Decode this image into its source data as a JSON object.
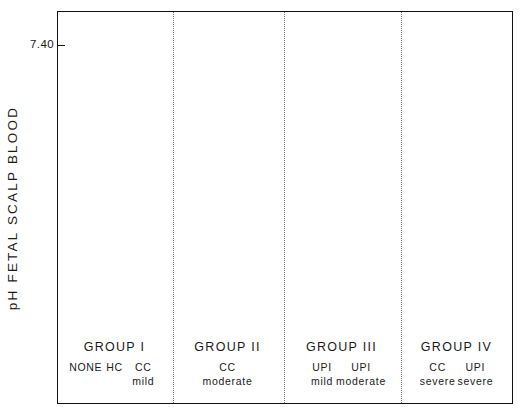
{
  "chart_data": {
    "type": "scatter",
    "title": "",
    "xlabel": "",
    "ylabel": "pH  FETAL  SCALP  BLOOD",
    "ylim": [
      7.0,
      7.44
    ],
    "ytick_labels": [
      "7.40",
      "7.30",
      "7.20",
      "7.10",
      "7.00"
    ],
    "ytick_values": [
      7.4,
      7.3,
      7.2,
      7.1,
      7.0
    ],
    "yminor_step": 0.05,
    "grid": false,
    "legend": "none",
    "error_bar_style": "mean with capped range",
    "groups": [
      {
        "name": "GROUP I",
        "points": [
          {
            "label_line1": "NONE",
            "label_line2": "",
            "mean": 7.3,
            "low": 7.257,
            "high": 7.343
          },
          {
            "label_line1": "HC",
            "label_line2": "",
            "mean": 7.3,
            "low": 7.257,
            "high": 7.342
          },
          {
            "label_line1": "CC",
            "label_line2": "mild",
            "mean": 7.29,
            "low": 7.236,
            "high": 7.333
          }
        ]
      },
      {
        "name": "GROUP II",
        "points": [
          {
            "label_line1": "CC",
            "label_line2": "moderate",
            "mean": 7.26,
            "low": 7.22,
            "high": 7.305
          }
        ]
      },
      {
        "name": "GROUP III",
        "points": [
          {
            "label_line1": "UPI",
            "label_line2": "mild",
            "mean": 7.22,
            "low": 7.162,
            "high": 7.278
          },
          {
            "label_line1": "UPI",
            "label_line2": "moderate",
            "mean": 7.21,
            "low": 7.152,
            "high": 7.265
          }
        ]
      },
      {
        "name": "GROUP IV",
        "points": [
          {
            "label_line1": "CC",
            "label_line2": "severe",
            "mean": 7.15,
            "low": 7.092,
            "high": 7.218
          },
          {
            "label_line1": "UPI",
            "label_line2": "severe",
            "mean": 7.125,
            "low": 7.064,
            "high": 7.195
          }
        ]
      }
    ]
  },
  "colors": {
    "ink": "#111111",
    "separator": "#777777",
    "background": "#ffffff"
  }
}
